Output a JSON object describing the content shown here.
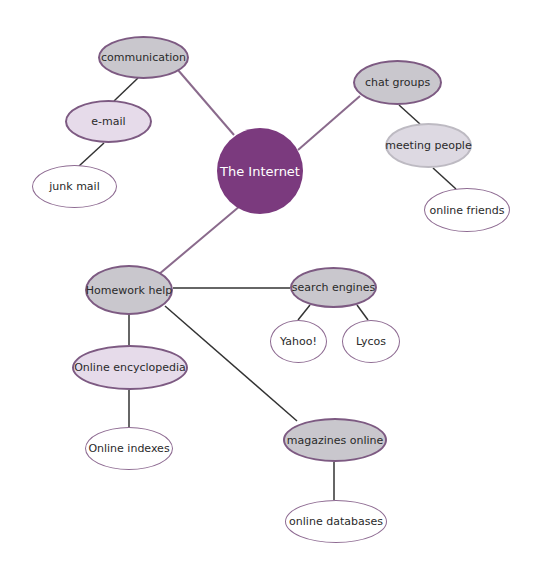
{
  "diagram": {
    "type": "concept-map",
    "colors": {
      "center_fill": "#7b3a7e",
      "primary_fill": "#c9c7cd",
      "primary_border": "#7d5a82",
      "secondary_fill": "#e6dbea",
      "leaf_fill": "#ffffff",
      "main_line": "#8a6a8c",
      "branch_line": "#333333"
    },
    "center": {
      "label": "The Internet"
    },
    "nodes": {
      "communication": {
        "label": "communication"
      },
      "email": {
        "label": "e-mail"
      },
      "junk_mail": {
        "label": "junk mail"
      },
      "chat_groups": {
        "label": "chat groups"
      },
      "meeting_people": {
        "label": "meeting people"
      },
      "online_friends": {
        "label": "online friends"
      },
      "homework_help": {
        "label": "Homework help"
      },
      "search_engines": {
        "label": "search engines"
      },
      "yahoo": {
        "label": "Yahoo!"
      },
      "lycos": {
        "label": "Lycos"
      },
      "online_encyclopedia": {
        "label": "Online encyclopedia"
      },
      "online_indexes": {
        "label": "Online indexes"
      },
      "magazines_online": {
        "label": "magazines online"
      },
      "online_databases": {
        "label": "online databases"
      }
    },
    "edges": [
      [
        "The Internet",
        "communication"
      ],
      [
        "communication",
        "e-mail"
      ],
      [
        "e-mail",
        "junk mail"
      ],
      [
        "The Internet",
        "chat groups"
      ],
      [
        "chat groups",
        "meeting people"
      ],
      [
        "meeting people",
        "online friends"
      ],
      [
        "The Internet",
        "Homework help"
      ],
      [
        "Homework help",
        "search engines"
      ],
      [
        "search engines",
        "Yahoo!"
      ],
      [
        "search engines",
        "Lycos"
      ],
      [
        "Homework help",
        "Online encyclopedia"
      ],
      [
        "Online encyclopedia",
        "Online indexes"
      ],
      [
        "Homework help",
        "magazines online"
      ],
      [
        "magazines online",
        "online databases"
      ]
    ]
  }
}
